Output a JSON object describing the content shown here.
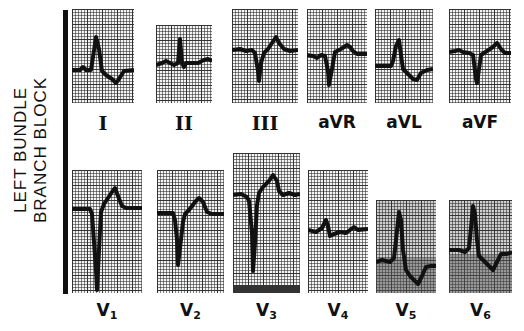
{
  "title": {
    "line1": "LEFT BUNDLE",
    "line2": "BRANCH BLOCK"
  },
  "limb_leads": [
    {
      "id": "I",
      "label": "I"
    },
    {
      "id": "II",
      "label": "II"
    },
    {
      "id": "III",
      "label": "III"
    },
    {
      "id": "aVR",
      "label": "aVR"
    },
    {
      "id": "aVL",
      "label": "aVL"
    },
    {
      "id": "aVF",
      "label": "aVF"
    }
  ],
  "precordial_leads": [
    {
      "id": "V1",
      "label_main": "V",
      "label_sub": "1"
    },
    {
      "id": "V2",
      "label_main": "V",
      "label_sub": "2"
    },
    {
      "id": "V3",
      "label_main": "V",
      "label_sub": "3"
    },
    {
      "id": "V4",
      "label_main": "V",
      "label_sub": "4"
    },
    {
      "id": "V5",
      "label_main": "V",
      "label_sub": "5"
    },
    {
      "id": "V6",
      "label_main": "V",
      "label_sub": "6"
    }
  ],
  "colors": {
    "trace": "#111111",
    "grid": "#333333",
    "paper": "#f4f4f4"
  }
}
